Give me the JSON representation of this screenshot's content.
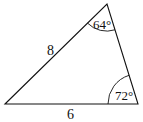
{
  "diagram": {
    "type": "triangle",
    "vertices": {
      "left": [
        5,
        104
      ],
      "top": [
        107,
        4
      ],
      "right": [
        138,
        104
      ]
    },
    "side_labels": {
      "left_side": "8",
      "bottom_side": "6"
    },
    "angle_labels": {
      "top": "64°",
      "right": "72°"
    },
    "stroke_color": "#111111"
  }
}
